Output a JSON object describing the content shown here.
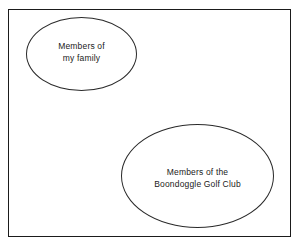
{
  "diagram": {
    "type": "venn-disjoint-sets",
    "background_color": "#ffffff",
    "stroke_color": "#1b1b1b",
    "text_color": "#1a1a1a",
    "universe": {
      "name": "universal-set-box",
      "shape": "rectangle",
      "label": ""
    },
    "sets": [
      {
        "id": "family",
        "shape": "ellipse",
        "label_lines": [
          "Members of",
          "my family"
        ],
        "line1": "Members of",
        "line2": "my family"
      },
      {
        "id": "golf",
        "shape": "ellipse",
        "label_lines": [
          "Members of the",
          "Boondoggle Golf Club"
        ],
        "line1": "Members of the",
        "line2": "Boondoggle Golf Club"
      }
    ]
  },
  "chart_data": {
    "type": "venn",
    "title": "",
    "relationship": "disjoint",
    "sets": [
      {
        "name": "Members of my family",
        "overlap_with_other": 0
      },
      {
        "name": "Members of the Boondoggle Golf Club",
        "overlap_with_other": 0
      }
    ],
    "intersection": 0,
    "legend": [],
    "annotations": [
      "Members of my family",
      "Members of the Boondoggle Golf Club"
    ]
  }
}
